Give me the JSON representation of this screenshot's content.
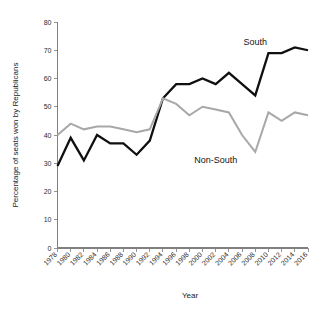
{
  "chart_data": {
    "type": "line",
    "title": "",
    "subtitle": "",
    "xlabel": "Year",
    "ylabel": "Percentage of seats won by Republicans",
    "xlim": [
      1978,
      2016
    ],
    "ylim": [
      0,
      80
    ],
    "ytick_step": 10,
    "xtick_step": 2,
    "grid": false,
    "legend": "inline-annotations",
    "categories": [
      1978,
      1980,
      1982,
      1984,
      1986,
      1988,
      1990,
      1992,
      1994,
      1996,
      1998,
      2000,
      2002,
      2004,
      2006,
      2008,
      2010,
      2012,
      2014,
      2016
    ],
    "xticks": [
      "1978",
      "1980",
      "1982",
      "1984",
      "1986",
      "1988",
      "1990",
      "1992",
      "1994",
      "1996",
      "1998",
      "2000",
      "2002",
      "2004",
      "2006",
      "2008",
      "2010",
      "2012",
      "2014",
      "2016"
    ],
    "yticks": [
      "0",
      "10",
      "20",
      "30",
      "40",
      "50",
      "60",
      "70",
      "80"
    ],
    "series": [
      {
        "name": "South",
        "color": "#101010",
        "values": [
          29,
          39,
          31,
          40,
          37,
          37,
          33,
          38,
          53,
          58,
          58,
          60,
          58,
          62,
          58,
          54,
          69,
          69,
          71,
          70
        ]
      },
      {
        "name": "Non-South",
        "color": "#a8a8a8",
        "values": [
          40,
          44,
          42,
          43,
          43,
          42,
          41,
          42,
          53,
          51,
          47,
          50,
          49,
          48,
          40,
          34,
          48,
          45,
          48,
          47
        ]
      }
    ],
    "annotations": [
      {
        "text": "South",
        "series": "South",
        "x": 2008,
        "y": 72
      },
      {
        "text": "Non-South",
        "series": "Non-South",
        "x": 2002,
        "y": 30
      }
    ]
  }
}
